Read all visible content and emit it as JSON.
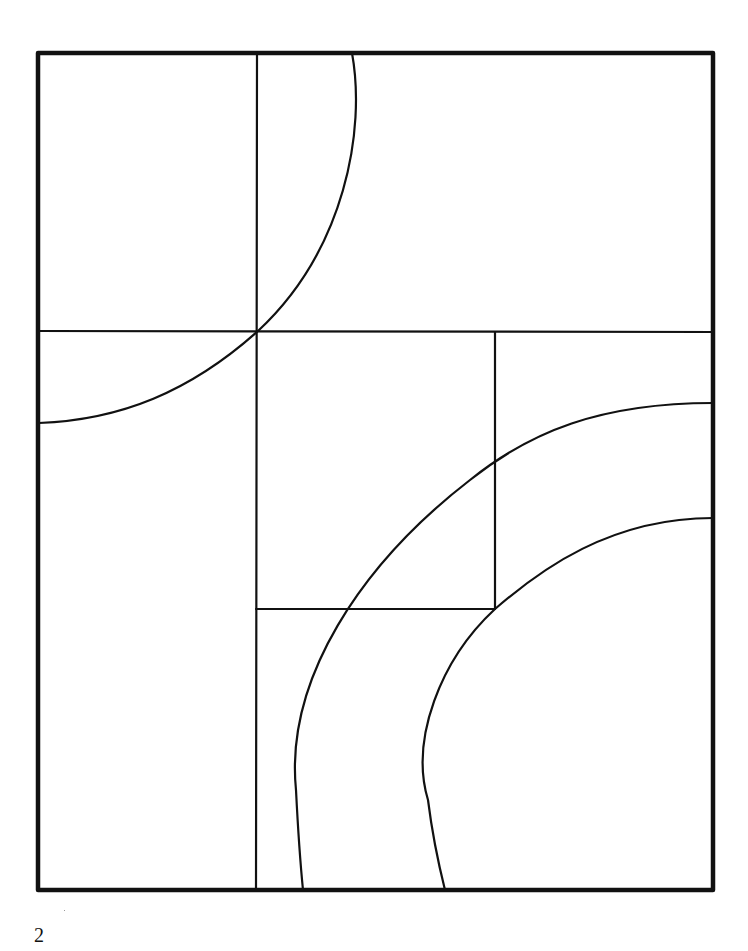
{
  "page": {
    "page_number": "2",
    "background_color": "#ffffff",
    "line_color": "#111111"
  },
  "artwork": {
    "description": "Geometric line-art coloring page: rectangular frame divided by straight lines and crossed by curved arcs",
    "frame": {
      "x1": 38,
      "y1": 53,
      "x2": 713,
      "y2": 890,
      "stroke_width": 4
    },
    "straight_lines": [
      {
        "name": "left-vertical-divider",
        "x1": 257,
        "y1": 53,
        "x2": 256,
        "y2": 890
      },
      {
        "name": "upper-horizontal-divider",
        "x1": 38,
        "y1": 331,
        "x2": 713,
        "y2": 332
      },
      {
        "name": "middle-vertical-divider",
        "x1": 495,
        "y1": 332,
        "x2": 495,
        "y2": 609
      },
      {
        "name": "lower-horizontal-divider",
        "x1": 256,
        "y1": 609,
        "x2": 495,
        "y2": 609
      }
    ],
    "arcs": [
      {
        "name": "top-left-arc",
        "path": "M352,53 C366,130 345,250 258,331 C190,392 120,420 39,423"
      },
      {
        "name": "large-outer-arc",
        "path": "M713,403 C600,403 530,432 470,480 C360,565 285,680 296,790 C298,830 300,860 303,890"
      },
      {
        "name": "inner-arc",
        "path": "M713,518 C610,518 540,570 495,609 C440,660 410,740 428,800 C433,840 440,870 445,890"
      }
    ]
  }
}
